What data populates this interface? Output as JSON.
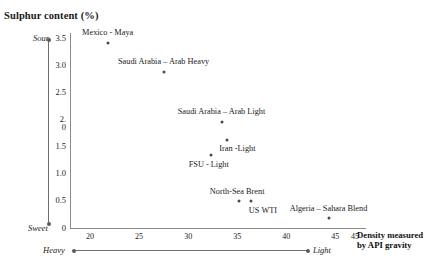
{
  "chart_data": {
    "type": "scatter",
    "title": "Sulphur content (%)",
    "xlabel": "Density measured by API gravity",
    "ylabel": "Sulphur content (%)",
    "xlim": [
      18.5,
      47.5
    ],
    "ylim": [
      0,
      3.7
    ],
    "grid": false,
    "legend": "none",
    "x_axis": {
      "ticks": [
        "20",
        "25",
        "30",
        "35",
        "40",
        "45",
        "45"
      ],
      "tick_values": [
        20,
        25,
        30,
        35,
        40,
        45,
        47
      ],
      "low_label": "Heavy",
      "high_label": "Light",
      "title_line1": "Density measured",
      "title_line2": "by API gravity"
    },
    "y_axis": {
      "ticks": [
        "3.5",
        "3.0",
        "2.5",
        "2.\n0",
        "1.5",
        "1.0",
        "0.5",
        "0"
      ],
      "tick_values": [
        3.5,
        3.0,
        2.5,
        2.0,
        1.5,
        1.0,
        0.5,
        0
      ],
      "high_label": "Sour",
      "low_label": "Sweet"
    },
    "points": [
      {
        "label": "Mexico - Maya",
        "x": 21.8,
        "y": 3.4,
        "label_dx": 0,
        "label_dy": -11
      },
      {
        "label": "Saudi Arabia – Arab Heavy",
        "x": 27.5,
        "y": 2.87,
        "label_dx": 0,
        "label_dy": -11
      },
      {
        "label": "Saudi Arabia – Arab Light",
        "x": 33.4,
        "y": 1.95,
        "label_dx": 0,
        "label_dy": -11
      },
      {
        "label": "Iran -Light",
        "x": 34.0,
        "y": 1.62,
        "label_dx": 10,
        "label_dy": 8
      },
      {
        "label": "FSU - Light",
        "x": 32.3,
        "y": 1.34,
        "label_dx": -2,
        "label_dy": 9
      },
      {
        "label": "North-Sea Brent",
        "x": 35.2,
        "y": 0.5,
        "label_dx": -2,
        "label_dy": -10
      },
      {
        "label": "US WTI",
        "x": 36.4,
        "y": 0.5,
        "label_dx": 12,
        "label_dy": 9
      },
      {
        "label": "Algeria – Sahara Blend",
        "x": 44.3,
        "y": 0.18,
        "label_dx": 0,
        "label_dy": -10
      }
    ],
    "colors": {
      "axis": "#8a8a8a",
      "marker": "#4a4a4a",
      "text": "#1a1a1a",
      "arrow": "#6d6d6d",
      "background": "#ffffff"
    }
  }
}
